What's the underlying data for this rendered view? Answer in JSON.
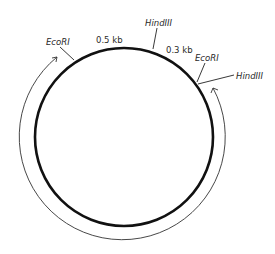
{
  "diagram": {
    "type": "plasmid-restriction-map",
    "plasmid": {
      "center": [
        124,
        137
      ],
      "radius": 89,
      "stroke_color": "#111111"
    },
    "sites": [
      {
        "enzyme": "EcoRI",
        "label": "EcoRI",
        "position": "upper-left"
      },
      {
        "enzyme": "HindIII",
        "label": "HindIII",
        "position": "top"
      },
      {
        "enzyme": "EcoRI",
        "label": "EcoRI",
        "position": "upper-right"
      },
      {
        "enzyme": "HindIII",
        "label": "HindIII",
        "position": "right"
      }
    ],
    "fragments": [
      {
        "label": "0.5 kb",
        "between": "EcoRI (upper-left) – HindIII (top)"
      },
      {
        "label": "0.3 kb",
        "between": "HindIII (top) – EcoRI (upper-right)"
      }
    ],
    "arrow": {
      "description": "Outer double-headed arc spanning the large remaining region around the bottom of the plasmid",
      "color": "#333333"
    }
  }
}
